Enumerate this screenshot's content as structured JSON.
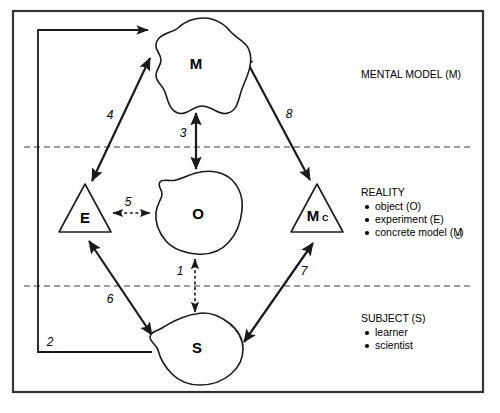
{
  "figure": {
    "frame": {
      "x": 13,
      "y": 11,
      "width": 470,
      "height": 381
    }
  },
  "nodes": [
    {
      "id": "M",
      "label": "M",
      "sub": "",
      "shape": "blob",
      "cx": 196,
      "cy": 64,
      "name": "node-mental-model"
    },
    {
      "id": "E",
      "label": "E",
      "sub": "",
      "shape": "triangle",
      "cx": 85,
      "cy": 213,
      "name": "node-experiment"
    },
    {
      "id": "O",
      "label": "O",
      "sub": "",
      "shape": "blob",
      "cx": 196,
      "cy": 213,
      "name": "node-object"
    },
    {
      "id": "MC",
      "label": "M",
      "sub": "C",
      "shape": "triangle",
      "cx": 317,
      "cy": 213,
      "name": "node-concrete-model"
    },
    {
      "id": "S",
      "label": "S",
      "sub": "",
      "shape": "blob",
      "cx": 196,
      "cy": 348,
      "name": "node-subject"
    }
  ],
  "arrows": [
    {
      "number": "1",
      "from": "O",
      "to": "S",
      "style": "dotted",
      "heads": "both",
      "label_x": 180,
      "label_y": 272
    },
    {
      "number": "2",
      "from": "S",
      "to": "M",
      "style": "solid",
      "heads": "end",
      "label_x": 50,
      "label_y": 343
    },
    {
      "number": "3",
      "from": "M",
      "to": "O",
      "style": "solid",
      "heads": "both",
      "label_x": 183,
      "label_y": 134
    },
    {
      "number": "4",
      "from": "E",
      "to": "M",
      "style": "solid",
      "heads": "both",
      "label_x": 110,
      "label_y": 116
    },
    {
      "number": "5",
      "from": "E",
      "to": "O",
      "style": "dotted",
      "heads": "both",
      "label_x": 128,
      "label_y": 203
    },
    {
      "number": "6",
      "from": "E",
      "to": "S",
      "style": "solid",
      "heads": "both",
      "label_x": 110,
      "label_y": 300
    },
    {
      "number": "7",
      "from": "S",
      "to": "MC",
      "style": "solid",
      "heads": "both",
      "label_x": 304,
      "label_y": 272
    },
    {
      "number": "8",
      "from": "M",
      "to": "MC",
      "style": "solid",
      "heads": "both",
      "label_x": 289,
      "label_y": 115
    }
  ],
  "bands": [
    {
      "name": "mental-model",
      "title": "MENTAL MODEL (M)",
      "title_x": 361,
      "title_y": 78,
      "items": []
    },
    {
      "name": "reality",
      "title": "REALITY",
      "title_x": 361,
      "title_y": 196,
      "items": [
        {
          "text": "object (O)",
          "sub": ""
        },
        {
          "text": "experiment (E)",
          "sub": ""
        },
        {
          "text": "concrete model (M",
          "sub": "C",
          "suffix": ")"
        }
      ]
    },
    {
      "name": "subject",
      "title": "SUBJECT (S)",
      "title_x": 361,
      "title_y": 322,
      "items": [
        {
          "text": "learner",
          "sub": ""
        },
        {
          "text": "scientist",
          "sub": ""
        }
      ]
    }
  ],
  "dividers": [
    {
      "name": "divider-mental-reality",
      "y": 147,
      "x1": 24,
      "x2": 472
    },
    {
      "name": "divider-reality-subject",
      "y": 286,
      "x1": 24,
      "x2": 472
    }
  ],
  "colors": {
    "stroke": "#1a1a1a",
    "divider": "#3a3a3a",
    "frame": "#333333",
    "background": "#ffffff"
  }
}
